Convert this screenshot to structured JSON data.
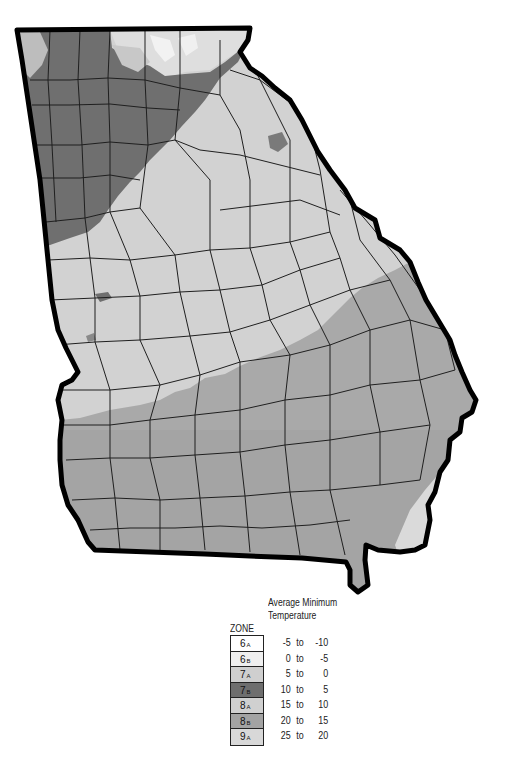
{
  "map": {
    "subject": "Georgia USDA Plant Hardiness Zones",
    "colors": {
      "zone_6a": "#ffffff",
      "zone_6b": "#efefef",
      "zone_7a": "#cfcfcf",
      "zone_7b": "#6e6e6e",
      "zone_8a": "#cdcdcd",
      "zone_8b": "#a3a3a3",
      "zone_9a": "#d8d8d8",
      "border": "#000000",
      "county_lines": "#222222"
    }
  },
  "legend": {
    "zone_header": "ZONE",
    "temp_header_line1": "Average Minimum",
    "temp_header_line2": "Temperature",
    "rows": [
      {
        "zone": "6",
        "sub": "A",
        "hi": "-5",
        "to": "to",
        "lo": "-10",
        "color": "#ffffff"
      },
      {
        "zone": "6",
        "sub": "B",
        "hi": "0",
        "to": "to",
        "lo": "-5",
        "color": "#efefef"
      },
      {
        "zone": "7",
        "sub": "A",
        "hi": "5",
        "to": "to",
        "lo": "0",
        "color": "#cfcfcf"
      },
      {
        "zone": "7",
        "sub": "B",
        "hi": "10",
        "to": "to",
        "lo": "5",
        "color": "#6e6e6e"
      },
      {
        "zone": "8",
        "sub": "A",
        "hi": "15",
        "to": "to",
        "lo": "10",
        "color": "#d0d0d0"
      },
      {
        "zone": "8",
        "sub": "B",
        "hi": "20",
        "to": "to",
        "lo": "15",
        "color": "#a3a3a3"
      },
      {
        "zone": "9",
        "sub": "A",
        "hi": "25",
        "to": "to",
        "lo": "20",
        "color": "#d8d8d8"
      }
    ]
  }
}
